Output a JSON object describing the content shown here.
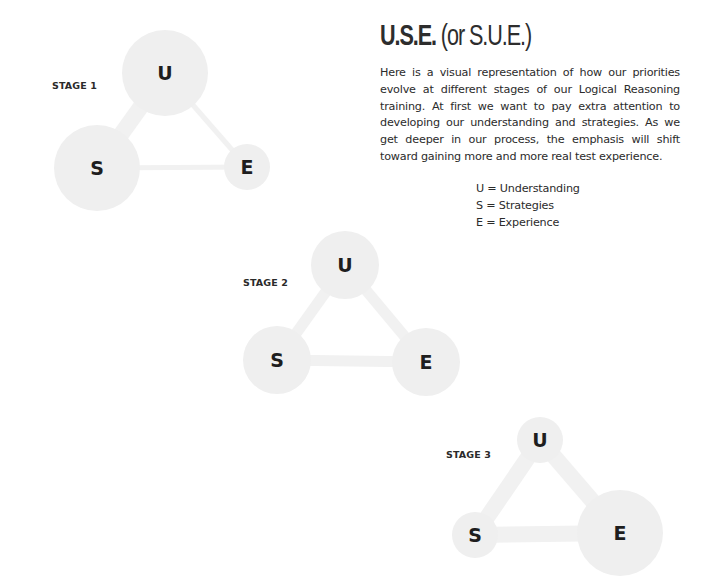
{
  "title": {
    "main": "U.S.E.",
    "alt": "(or S.U.E.)"
  },
  "description": "Here is a visual representation of how our priorities evolve at different stages of our Logical Reasoning training. At first we want to pay extra attention to developing our understanding and strategies. As we get deeper in our process, the emphasis will shift toward gaining more and more real test experience.",
  "legend": [
    {
      "key": "U",
      "text": "U = Understanding"
    },
    {
      "key": "S",
      "text": "S = Strategies"
    },
    {
      "key": "E",
      "text": "E = Experience"
    }
  ],
  "colors": {
    "node_fill": "#efefef",
    "connector": "#f1f1f1",
    "letter": "#1e1e1e"
  },
  "stages": [
    {
      "label": "STAGE 1",
      "nodes": [
        {
          "id": "U",
          "letter": "U",
          "emphasis": "large"
        },
        {
          "id": "S",
          "letter": "S",
          "emphasis": "large"
        },
        {
          "id": "E",
          "letter": "E",
          "emphasis": "small"
        }
      ],
      "links": [
        {
          "from": "U",
          "to": "S",
          "emphasis": "strong"
        },
        {
          "from": "U",
          "to": "E",
          "emphasis": "weak"
        },
        {
          "from": "S",
          "to": "E",
          "emphasis": "weak"
        }
      ]
    },
    {
      "label": "STAGE 2",
      "nodes": [
        {
          "id": "U",
          "letter": "U",
          "emphasis": "medium"
        },
        {
          "id": "S",
          "letter": "S",
          "emphasis": "medium"
        },
        {
          "id": "E",
          "letter": "E",
          "emphasis": "medium"
        }
      ],
      "links": [
        {
          "from": "U",
          "to": "S",
          "emphasis": "medium"
        },
        {
          "from": "U",
          "to": "E",
          "emphasis": "medium"
        },
        {
          "from": "S",
          "to": "E",
          "emphasis": "medium"
        }
      ]
    },
    {
      "label": "STAGE 3",
      "nodes": [
        {
          "id": "U",
          "letter": "U",
          "emphasis": "small"
        },
        {
          "id": "S",
          "letter": "S",
          "emphasis": "small"
        },
        {
          "id": "E",
          "letter": "E",
          "emphasis": "large"
        }
      ],
      "links": [
        {
          "from": "U",
          "to": "S",
          "emphasis": "strong"
        },
        {
          "from": "U",
          "to": "E",
          "emphasis": "strong"
        },
        {
          "from": "S",
          "to": "E",
          "emphasis": "strong"
        }
      ]
    }
  ]
}
